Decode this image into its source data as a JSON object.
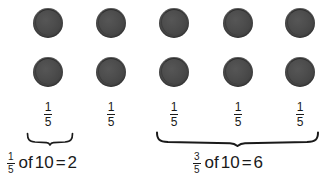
{
  "figure": {
    "kind": "fraction-of-a-set-diagram",
    "total_counters": 10,
    "rows": 2,
    "columns": 5,
    "counter_color": "#474747",
    "background_color": "#ffffff",
    "text_color": "#1a1a1a"
  },
  "counters": {
    "icon_name": "counter-disc-icon",
    "diameter_px": 30,
    "column_centers_x": [
      48,
      111,
      174,
      238,
      300
    ],
    "row_centers_y": [
      23,
      72
    ]
  },
  "column_labels": [
    {
      "numerator": "1",
      "denominator": "5",
      "center_x": 48
    },
    {
      "numerator": "1",
      "denominator": "5",
      "center_x": 111
    },
    {
      "numerator": "1",
      "denominator": "5",
      "center_x": 174
    },
    {
      "numerator": "1",
      "denominator": "5",
      "center_x": 238
    },
    {
      "numerator": "1",
      "denominator": "5",
      "center_x": 300
    }
  ],
  "braces": [
    {
      "name": "brace-one-fifth",
      "spans_columns": 1,
      "x": 27,
      "width": 46
    },
    {
      "name": "brace-three-fifths",
      "spans_columns": 3,
      "x": 157,
      "width": 164
    }
  ],
  "captions": [
    {
      "name": "caption-one-fifth",
      "numerator": "1",
      "denominator": "5",
      "word": "of",
      "total": "10",
      "equals": "=",
      "result": "2",
      "full_text": "1/5 of 10 = 2"
    },
    {
      "name": "caption-three-fifths",
      "numerator": "3",
      "denominator": "5",
      "word": "of",
      "total": "10",
      "equals": "=",
      "result": "6",
      "full_text": "3/5 of 10 = 6"
    }
  ]
}
